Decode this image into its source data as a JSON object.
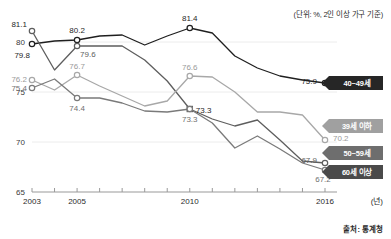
{
  "notes": {
    "unit": "(단위: %, 2인 이상 가구 기준)",
    "source": "출처: 통계청",
    "x_axis_unit": "(년)"
  },
  "chart_data": {
    "type": "line",
    "title": "",
    "xlabel": "(년)",
    "ylabel": "",
    "ylim": [
      65,
      82
    ],
    "yticks": [
      65,
      70,
      75,
      80
    ],
    "xlim": [
      2003,
      2016
    ],
    "xticks_labeled": [
      2003,
      2005,
      2010,
      2016
    ],
    "xticks_all": [
      2003,
      2004,
      2005,
      2006,
      2007,
      2008,
      2009,
      2010,
      2011,
      2012,
      2013,
      2014,
      2015,
      2016
    ],
    "grid": "horizontal-light",
    "legend_position": "right",
    "x": [
      2003,
      2004,
      2005,
      2006,
      2007,
      2008,
      2009,
      2010,
      2011,
      2012,
      2013,
      2014,
      2015,
      2016
    ],
    "series": [
      {
        "name": "40~49세",
        "color": "#1f1f1f",
        "values": [
          79.8,
          80.1,
          80.2,
          80.6,
          80.7,
          79.7,
          80.6,
          81.4,
          80.9,
          78.6,
          77.4,
          76.6,
          76.2,
          75.9
        ],
        "labels": [
          {
            "x": 2003,
            "value": 79.8,
            "text": "79.8",
            "tone": "dark"
          },
          {
            "x": 2005,
            "value": 80.2,
            "text": "80.2",
            "tone": "dark"
          },
          {
            "x": 2010,
            "value": 81.4,
            "text": "81.4",
            "tone": "dark"
          },
          {
            "x": 2016,
            "value": 75.9,
            "text": "75.9",
            "tone": "dark"
          }
        ],
        "markers": [
          2003,
          2005,
          2010,
          2016
        ]
      },
      {
        "name": "50~59세",
        "color": "#5e5e5e",
        "values": [
          81.1,
          77.2,
          79.6,
          79.6,
          79.6,
          78.2,
          76.1,
          73.3,
          72.3,
          71.6,
          72.2,
          70.2,
          68.1,
          67.9
        ],
        "labels": [
          {
            "x": 2003,
            "value": 81.1,
            "text": "81.1",
            "tone": "dark"
          },
          {
            "x": 2005,
            "value": 79.6,
            "text": "79.6",
            "tone": "mid"
          },
          {
            "x": 2010,
            "value": 73.3,
            "text": "73.3",
            "tone": "dark"
          },
          {
            "x": 2016,
            "value": 67.9,
            "text": "67.9",
            "tone": "mid"
          }
        ],
        "markers": [
          2003,
          2005,
          2010,
          2016
        ]
      },
      {
        "name": "39세 이하",
        "color": "#a8a8a8",
        "values": [
          76.2,
          75.2,
          76.7,
          75.6,
          74.6,
          73.6,
          74.1,
          76.6,
          76.5,
          75.0,
          73.0,
          73.0,
          72.7,
          70.2
        ],
        "labels": [
          {
            "x": 2003,
            "value": 76.2,
            "text": "76.2",
            "tone": "light"
          },
          {
            "x": 2005,
            "value": 76.7,
            "text": "76.7",
            "tone": "light"
          },
          {
            "x": 2010,
            "value": 76.6,
            "text": "76.6",
            "tone": "light"
          },
          {
            "x": 2016,
            "value": 70.2,
            "text": "70.2",
            "tone": "light"
          }
        ],
        "markers": [
          2003,
          2005,
          2010,
          2016
        ]
      },
      {
        "name": "60세 이상",
        "color": "#7a7a7a",
        "values": [
          75.4,
          76.3,
          74.4,
          74.4,
          73.9,
          73.1,
          73.0,
          73.3,
          71.9,
          69.4,
          70.6,
          69.3,
          67.9,
          67.2
        ],
        "labels": [
          {
            "x": 2003,
            "value": 75.4,
            "text": "75.4",
            "tone": "mid2"
          },
          {
            "x": 2005,
            "value": 74.4,
            "text": "74.4",
            "tone": "mid2"
          },
          {
            "x": 2010,
            "value": 73.3,
            "text": "73.3",
            "tone": "mid2"
          },
          {
            "x": 2016,
            "value": 67.2,
            "text": "67.2",
            "tone": "mid2"
          }
        ],
        "markers": [
          2003,
          2005,
          2010,
          2016
        ]
      }
    ],
    "legend": [
      {
        "label": "40~49세",
        "color": "#262626",
        "y_value": 75.9
      },
      {
        "label": "39세 이하",
        "color": "#a0a0a0",
        "y_value": 71.6
      },
      {
        "label": "50~59세",
        "color": "#6e6e6e",
        "y_value": 68.9
      },
      {
        "label": "60세 이상",
        "color": "#4a4a4a",
        "y_value": 67.0
      }
    ],
    "ytick_labels": [
      "80",
      "75",
      "70",
      "65"
    ],
    "xtick_labels": [
      "2003",
      "2005",
      "2010",
      "2016"
    ]
  }
}
